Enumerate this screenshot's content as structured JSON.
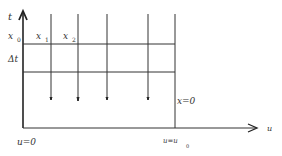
{
  "diagram": {
    "axes": {
      "vertical_label": "t",
      "horizontal_label": "u"
    },
    "labels": {
      "x0": {
        "base": "x",
        "sub": "0"
      },
      "x1": {
        "base": "x",
        "sub": "1"
      },
      "x2": {
        "base": "x",
        "sub": "2"
      },
      "delta_t": "Δt",
      "x_equals_zero": "x=0",
      "u_equals_zero": "u=0",
      "u_equals_u0": {
        "base": "u=u",
        "sub": "0"
      }
    },
    "colors": {
      "line": "#333333",
      "background": "#ffffff"
    }
  }
}
